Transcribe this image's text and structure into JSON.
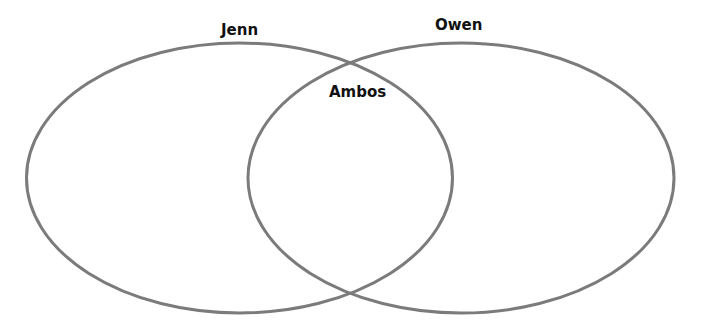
{
  "diagram": {
    "type": "venn",
    "stroke_color": "#7b7b7b",
    "sets": [
      {
        "id": "left",
        "label": "Jenn"
      },
      {
        "id": "right",
        "label": "Owen"
      }
    ],
    "intersection": {
      "label": "Ambos"
    }
  }
}
